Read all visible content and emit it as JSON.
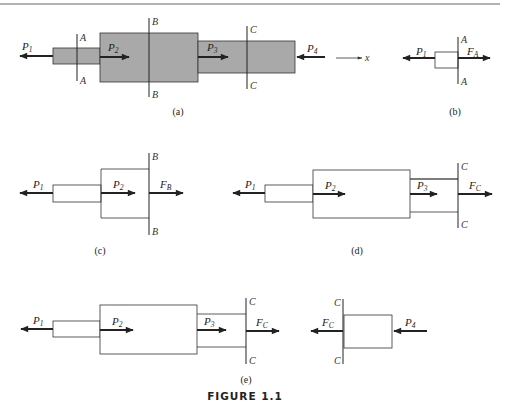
{
  "figure": {
    "title": "FIGURE 1.1",
    "rule_color": "#9a9a9a",
    "fill_color": "#a9a9a9",
    "line_color": "#222222"
  },
  "panels": {
    "a": {
      "caption": "(a)",
      "forces": {
        "p1": "P",
        "p1_sub": "1",
        "p2": "P",
        "p2_sub": "2",
        "p3": "P",
        "p3_sub": "3",
        "p4": "P",
        "p4_sub": "4"
      },
      "sections": {
        "a_top": "A",
        "a_bottom": "A",
        "b_top": "B",
        "b_bottom": "B",
        "c_top": "C",
        "c_bottom": "C"
      },
      "axis_label": "x"
    },
    "b": {
      "caption": "(b)",
      "forces": {
        "p1": "P",
        "p1_sub": "1",
        "fa": "F",
        "fa_sub": "A"
      },
      "sections": {
        "a_top": "A",
        "a_bottom": "A"
      }
    },
    "c": {
      "caption": "(c)",
      "forces": {
        "p1": "P",
        "p1_sub": "1",
        "p2": "P",
        "p2_sub": "2",
        "fb": "F",
        "fb_sub": "B"
      },
      "sections": {
        "b_top": "B",
        "b_bottom": "B"
      }
    },
    "d": {
      "caption": "(d)",
      "forces": {
        "p1": "P",
        "p1_sub": "1",
        "p2": "P",
        "p2_sub": "2",
        "p3": "P",
        "p3_sub": "3",
        "fc": "F",
        "fc_sub": "C"
      },
      "sections": {
        "c_top": "C",
        "c_bottom": "C"
      }
    },
    "e": {
      "caption": "(e)",
      "left": {
        "forces": {
          "p1": "P",
          "p1_sub": "1",
          "p2": "P",
          "p2_sub": "2",
          "p3": "P",
          "p3_sub": "3",
          "fc": "F",
          "fc_sub": "C"
        },
        "sections": {
          "c_top": "C",
          "c_bottom": "C"
        }
      },
      "right": {
        "forces": {
          "fc": "F",
          "fc_sub": "C",
          "p4": "P",
          "p4_sub": "4"
        },
        "sections": {
          "c_top": "C",
          "c_bottom": "C"
        }
      }
    }
  }
}
